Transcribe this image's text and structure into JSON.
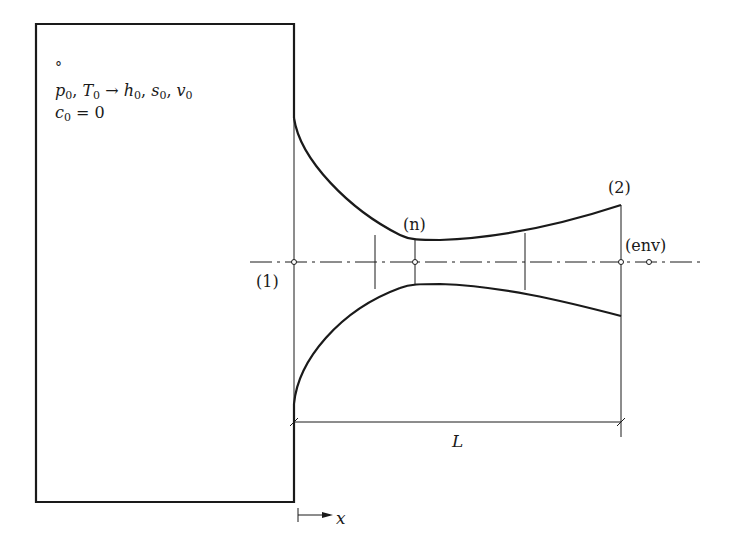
{
  "diagram": {
    "type": "nozzle-schematic",
    "tank": {
      "state_marker": "°",
      "line1": {
        "p": "p",
        "p_sub": "0",
        "sep1": ", ",
        "T": "T",
        "T_sub": "0",
        "arrow": " → ",
        "h": "h",
        "h_sub": "0",
        "sep2": ", ",
        "s": "s",
        "s_sub": "0",
        "sep3": ", ",
        "v": "v",
        "v_sub": "0"
      },
      "line2": {
        "c": "c",
        "c_sub": "0",
        "eq": " = 0"
      }
    },
    "stations": {
      "inlet": "(1)",
      "throat": "(n)",
      "exit": "(2)",
      "environment": "(env)"
    },
    "dimension": {
      "length_label": "L"
    },
    "axis": {
      "x_label": "x"
    }
  }
}
